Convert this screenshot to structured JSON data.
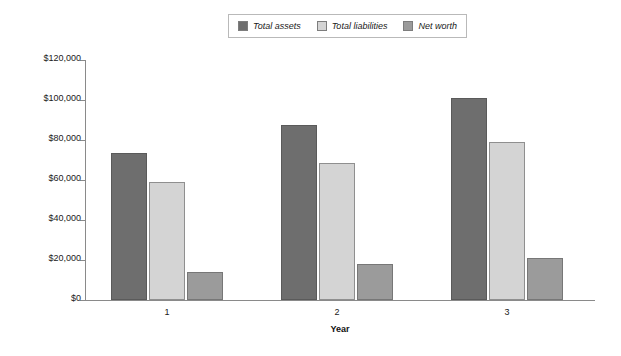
{
  "chart_data": {
    "type": "bar",
    "title": "",
    "xlabel": "Year",
    "ylabel": "",
    "categories": [
      "1",
      "2",
      "3"
    ],
    "series": [
      {
        "name": "Total assets",
        "values": [
          73500,
          87500,
          101000
        ],
        "color": "#6e6e6e"
      },
      {
        "name": "Total liabilities",
        "values": [
          59000,
          68500,
          79000
        ],
        "color": "#d4d4d4"
      },
      {
        "name": "Net worth",
        "values": [
          14000,
          18000,
          21000
        ],
        "color": "#9b9b9b"
      }
    ],
    "ylim": [
      0,
      120000
    ],
    "ytick_values": [
      0,
      20000,
      40000,
      60000,
      80000,
      100000,
      120000
    ],
    "ytick_labels": [
      "$0",
      "$20,000",
      "$40,000",
      "$60,000",
      "$80,000",
      "$100,000",
      "$120,000"
    ],
    "grid": false,
    "legend_position": "top-center"
  },
  "legend": {
    "entries": [
      {
        "label": "Total assets"
      },
      {
        "label": "Total liabilities"
      },
      {
        "label": "Net worth"
      }
    ]
  },
  "axes": {
    "x_title": "Year"
  }
}
